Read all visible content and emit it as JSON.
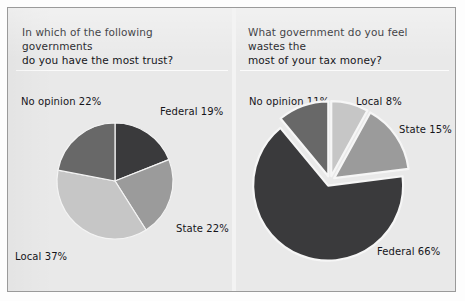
{
  "figure": {
    "background_color": "#e9e9e9",
    "border_color": "#9a9a9a",
    "divider_color": "#f3f3f3"
  },
  "palette": {
    "federal": "#3a3a3c",
    "state": "#9b9b9b",
    "local": "#c6c6c6",
    "no_opinion": "#686868",
    "gap": "#f4f4f4",
    "text": "#15151a"
  },
  "panels": [
    {
      "id": "trust",
      "question": "In which of the following governments\ndo you have the most trust?",
      "labels": {
        "no_opinion": "No opinion 22%",
        "federal": "Federal 19%",
        "state": "State 22%",
        "local": "Local 37%"
      }
    },
    {
      "id": "waste",
      "question": "What government do you feel wastes the\nmost of your tax money?",
      "labels": {
        "no_opinion": "No opinion 11%",
        "local": "Local 8%",
        "state": "State 15%",
        "federal": "Federal 66%"
      }
    }
  ],
  "chart_data": [
    {
      "type": "pie",
      "id": "trust-pie",
      "title": "In which of the following governments do you have the most trust?",
      "categories": [
        "Federal",
        "State",
        "Local",
        "No opinion"
      ],
      "values": [
        19,
        22,
        37,
        22
      ],
      "value_unit": "percent",
      "data_labels": [
        "Federal 19%",
        "State 22%",
        "Local 37%",
        "No opinion 22%"
      ],
      "colors": [
        "#3a3a3c",
        "#9b9b9b",
        "#c6c6c6",
        "#686868"
      ],
      "start_angle_deg": 0,
      "direction": "clockwise",
      "exploded": false,
      "center": [
        115,
        181
      ],
      "radius": 58,
      "legend": "none",
      "grid": false
    },
    {
      "type": "pie",
      "id": "waste-pie",
      "title": "What government do you feel wastes the most of your tax money?",
      "categories": [
        "Local",
        "State",
        "Federal",
        "No opinion"
      ],
      "values": [
        8,
        15,
        66,
        11
      ],
      "value_unit": "percent",
      "data_labels": [
        "Local 8%",
        "State 15%",
        "Federal 66%",
        "No opinion 11%"
      ],
      "colors": [
        "#c6c6c6",
        "#9b9b9b",
        "#3a3a3c",
        "#686868"
      ],
      "start_angle_deg": 0,
      "direction": "clockwise",
      "exploded": true,
      "explode_offset": 5,
      "center": [
        330,
        181
      ],
      "radius": 75,
      "legend": "none",
      "grid": false
    }
  ]
}
